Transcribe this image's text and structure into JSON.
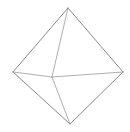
{
  "figure": {
    "name": "octahedron-wireframe",
    "background_color": "#ffffff",
    "canvas": {
      "width": 130,
      "height": 132
    }
  },
  "style": {
    "edge_color": "#9a9a9a",
    "edge_color_dark": "#7d7d7d",
    "edge_width": 0.9,
    "edge_width_thin": 0.8
  },
  "chart_data": {
    "type": "line",
    "xlabel": "",
    "ylabel": "",
    "xlim": [
      0,
      130
    ],
    "ylim": [
      0,
      132
    ],
    "grid": false,
    "legend": null,
    "vertices": [
      {
        "id": "top",
        "label": "top apex",
        "x": 68,
        "y": 8
      },
      {
        "id": "left",
        "label": "left vertex",
        "x": 13,
        "y": 72
      },
      {
        "id": "right",
        "label": "right vertex",
        "x": 123,
        "y": 72
      },
      {
        "id": "bottom",
        "label": "bottom apex",
        "x": 70,
        "y": 124
      },
      {
        "id": "interior",
        "label": "interior vertex",
        "x": 52,
        "y": 77
      }
    ],
    "edges": [
      {
        "id": "edge-left-top",
        "from": "left",
        "to": "top",
        "kind": "silhouette"
      },
      {
        "id": "edge-top-right",
        "from": "top",
        "to": "right",
        "kind": "silhouette"
      },
      {
        "id": "edge-right-bottom",
        "from": "right",
        "to": "bottom",
        "kind": "silhouette"
      },
      {
        "id": "edge-bottom-left",
        "from": "bottom",
        "to": "left",
        "kind": "silhouette"
      },
      {
        "id": "edge-left-interior",
        "from": "left",
        "to": "interior",
        "kind": "interior"
      },
      {
        "id": "edge-interior-right",
        "from": "interior",
        "to": "right",
        "kind": "interior"
      },
      {
        "id": "edge-top-interior",
        "from": "top",
        "to": "interior",
        "kind": "interior"
      },
      {
        "id": "edge-interior-bottom",
        "from": "interior",
        "to": "bottom",
        "kind": "interior"
      }
    ]
  }
}
